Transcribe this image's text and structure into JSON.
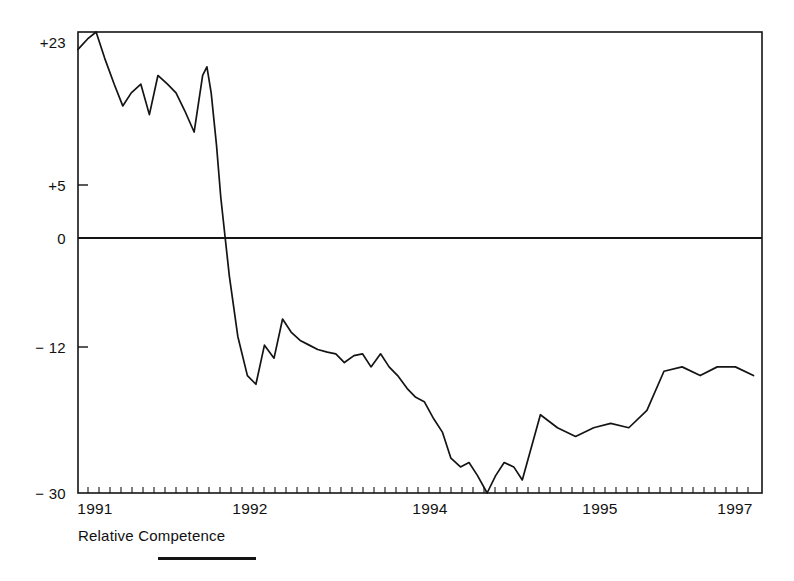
{
  "chart_data": {
    "type": "line",
    "title": "",
    "subtitle": "",
    "xlabel": "",
    "ylabel": "",
    "legend": [
      {
        "name": "Relative Competence",
        "color": "#141414"
      }
    ],
    "legend_position": "below-axis-left",
    "grid": false,
    "axis_line_color": "#141414",
    "zero_line": 0,
    "zero_line_visible": true,
    "xlim": [
      1990.83,
      1997.25
    ],
    "ylim": [
      -30,
      23
    ],
    "ytick_labels": [
      "+23",
      "+5",
      "0",
      "− 12",
      "− 30"
    ],
    "ytick_values": [
      23,
      5,
      0,
      -12,
      -30
    ],
    "xtick_labels": [
      "1991",
      "1992",
      "1994",
      "1995",
      "1997"
    ],
    "xtick_values": [
      1991,
      1992,
      1994,
      1995,
      1997
    ],
    "minor_tick_interval_label": "monthly",
    "series": [
      {
        "name": "Relative Competence",
        "color": "#141414",
        "x": [
          1990.83,
          1990.92,
          1991.0,
          1991.08,
          1991.17,
          1991.25,
          1991.33,
          1991.42,
          1991.5,
          1991.58,
          1991.67,
          1991.75,
          1991.83,
          1991.92,
          1992.0,
          1992.04,
          1992.08,
          1992.13,
          1992.17,
          1992.25,
          1992.33,
          1992.42,
          1992.5,
          1992.58,
          1992.67,
          1992.75,
          1992.83,
          1992.92,
          1993.0,
          1993.08,
          1993.17,
          1993.25,
          1993.33,
          1993.42,
          1993.5,
          1993.58,
          1993.67,
          1993.75,
          1993.83,
          1993.92,
          1994.0,
          1994.08,
          1994.17,
          1994.25,
          1994.33,
          1994.42,
          1994.5,
          1994.58,
          1994.67,
          1994.75,
          1994.83,
          1994.92,
          1995.0,
          1995.17,
          1995.33,
          1995.5,
          1995.67,
          1995.83,
          1996.0,
          1996.17,
          1996.33,
          1996.5,
          1996.67,
          1996.83,
          1997.0,
          1997.17
        ],
        "y": [
          21.0,
          22.2,
          23.0,
          20.0,
          17.0,
          14.5,
          16.0,
          17.0,
          13.5,
          18.0,
          17.0,
          16.0,
          14.0,
          11.5,
          18.0,
          19.0,
          16.0,
          10.0,
          4.0,
          -5.0,
          -12.0,
          -16.5,
          -17.5,
          -13.0,
          -14.5,
          -10.0,
          -11.5,
          -12.5,
          -13.0,
          -13.5,
          -13.8,
          -14.0,
          -15.0,
          -14.2,
          -14.0,
          -15.5,
          -14.0,
          -15.5,
          -16.5,
          -18.0,
          -19.0,
          -19.5,
          -21.5,
          -23.0,
          -26.0,
          -27.0,
          -26.5,
          -28.0,
          -30.0,
          -28.0,
          -26.5,
          -27.0,
          -28.5,
          -21.0,
          -22.5,
          -23.5,
          -22.5,
          -22.0,
          -22.5,
          -20.5,
          -16.0,
          -15.5,
          -16.5,
          -15.5,
          -15.5,
          -16.5
        ]
      }
    ],
    "annotations": []
  },
  "legend_text": "Relative Competence"
}
